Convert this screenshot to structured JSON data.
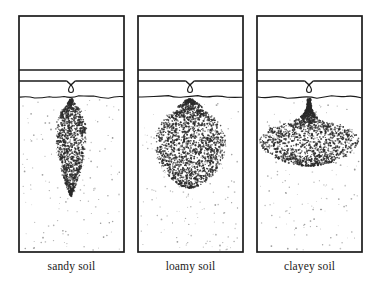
{
  "figure": {
    "background_color": "#ffffff",
    "line_color": "#1a1a1a",
    "dry_soil_dot_color": "#8a8a8a",
    "wet_bulb_dot_color": "#2a2a2a",
    "width": 379,
    "height": 282
  },
  "panels": [
    {
      "id": "sandy",
      "label": "sandy soil",
      "box": {
        "x": 19,
        "y": 16,
        "width": 105,
        "height": 236
      },
      "air_gap": {
        "y": 16,
        "height": 51
      },
      "pipe_band": {
        "y": 70,
        "height": 11
      },
      "soil_surface_y": 97,
      "emitter": {
        "notch_x": 71,
        "notch_y": 81,
        "drop_cx": 71,
        "drop_cy": 89
      },
      "wetting_bulb": {
        "shape": "narrow-elongated-teardrop",
        "description": "deep narrow vertical plume — water moves mostly downward",
        "center_x": 71,
        "top_y": 99,
        "bottom_y": 196,
        "max_half_width": 15,
        "widest_at_y": 140,
        "dot_count": 1150
      },
      "dry_dot_count": 150
    },
    {
      "id": "loamy",
      "label": "loamy soil",
      "box": {
        "x": 138,
        "y": 16,
        "width": 105,
        "height": 236
      },
      "air_gap": {
        "y": 16,
        "height": 51
      },
      "pipe_band": {
        "y": 70,
        "height": 11
      },
      "soil_surface_y": 97,
      "emitter": {
        "notch_x": 190,
        "notch_y": 81,
        "drop_cx": 190,
        "drop_cy": 89
      },
      "wetting_bulb": {
        "shape": "round-onion-sphere",
        "description": "near-spherical bulb with narrow neck — balanced lateral and vertical movement",
        "center_x": 190,
        "top_y": 99,
        "bottom_y": 188,
        "max_half_width": 35,
        "widest_at_y": 150,
        "dot_count": 1800
      },
      "dry_dot_count": 150
    },
    {
      "id": "clayey",
      "label": "clayey soil",
      "box": {
        "x": 257,
        "y": 16,
        "width": 105,
        "height": 236
      },
      "air_gap": {
        "y": 16,
        "height": 51
      },
      "pipe_band": {
        "y": 70,
        "height": 11
      },
      "soil_surface_y": 97,
      "emitter": {
        "notch_x": 309,
        "notch_y": 81,
        "drop_cx": 309,
        "drop_cy": 89
      },
      "wetting_bulb": {
        "shape": "wide-flat-mushroom",
        "description": "broad shallow flattened ellipse with narrow stem — water spreads sideways",
        "center_x": 309,
        "top_y": 99,
        "bottom_y": 166,
        "max_half_width": 49,
        "widest_at_y": 146,
        "dot_count": 1700
      },
      "dry_dot_count": 150
    }
  ],
  "labels_baseline_y": 270
}
